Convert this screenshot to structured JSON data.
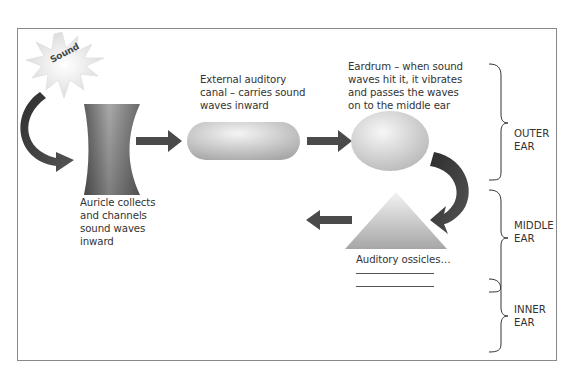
{
  "diagram": {
    "title_burst": "Sound",
    "stages": [
      {
        "id": "auricle",
        "label": "Auricle collects and channels sound waves inward",
        "lines": [
          "Auricle collects",
          "and channels",
          "sound waves",
          "inward"
        ],
        "shape": "curved-panel"
      },
      {
        "id": "canal",
        "label": "External auditory canal – carries sound waves inward",
        "lines": [
          "External auditory",
          "canal – carries sound",
          "waves inward"
        ],
        "shape": "capsule"
      },
      {
        "id": "eardrum",
        "label": "Eardrum – when sound waves hit it, it vibrates and passes the waves on to the middle ear",
        "lines": [
          "Eardrum – when sound",
          "waves hit it, it vibrates",
          "and passes the waves",
          "on to the middle ear"
        ],
        "shape": "ellipse"
      },
      {
        "id": "ossicles",
        "label": "Auditory ossicles…",
        "lines": [
          "Auditory ossicles…"
        ],
        "shape": "triangle",
        "blank_lines": 2
      }
    ],
    "sections": [
      {
        "lines": [
          "OUTER",
          "EAR"
        ]
      },
      {
        "lines": [
          "MIDDLE",
          "EAR"
        ]
      },
      {
        "lines": [
          "INNER",
          "EAR"
        ]
      }
    ],
    "colors": {
      "arrow": "#4a4a4a",
      "shape_light": "#f4f4f4",
      "shape_dark": "#9c9c9c",
      "border": "#8a8a8a"
    }
  }
}
